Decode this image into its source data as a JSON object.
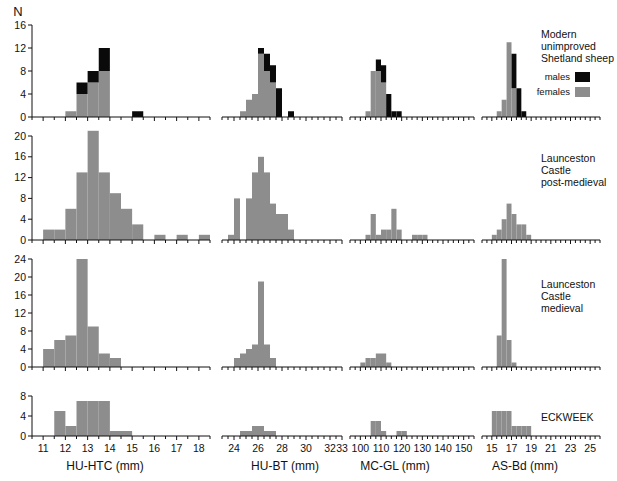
{
  "figure": {
    "y_axis_label": "N",
    "colors": {
      "males": "#0a0a0a",
      "females": "#8d8d8d",
      "axis": "#111111"
    },
    "legend": {
      "title_line1": "Modern",
      "title_line2": "unimproved",
      "title_line3": "Shetland sheep",
      "males_label": "males",
      "females_label": "females"
    },
    "row_labels": [
      {
        "lines": [
          "Modern",
          "unimproved",
          "Shetland sheep"
        ]
      },
      {
        "lines": [
          "Launceston",
          "Castle",
          "post-medieval"
        ]
      },
      {
        "lines": [
          "Launceston",
          "Castle",
          "medieval"
        ]
      },
      {
        "lines": [
          "ECKWEEK"
        ]
      }
    ],
    "column_titles": [
      "HU-HTC (mm)",
      "HU-BT (mm)",
      "MC-GL (mm)",
      "AS-Bd (mm)"
    ]
  },
  "chart_data": [
    {
      "type": "bar",
      "title": "Modern unimproved Shetland sheep — HU-HTC",
      "row": "Modern unimproved Shetland sheep",
      "xlabel": "HU-HTC (mm)",
      "ylabel": "N",
      "xlim": [
        10.5,
        18.5
      ],
      "ylim": [
        0,
        16
      ],
      "yticks": [
        0,
        4,
        8,
        12,
        16
      ],
      "xticks": [
        11,
        12,
        13,
        14,
        15,
        16,
        17,
        18
      ],
      "bin_width": 0.5,
      "grid": false,
      "series": [
        {
          "name": "females",
          "color": "#8d8d8d",
          "bins": [
            12.0,
            12.5,
            13.0,
            13.5
          ],
          "values": [
            1,
            4,
            6,
            8
          ]
        },
        {
          "name": "males",
          "color": "#0a0a0a",
          "bins": [
            12.5,
            13.0,
            13.5,
            15.0
          ],
          "values": [
            2,
            2,
            4,
            1
          ]
        }
      ]
    },
    {
      "type": "bar",
      "title": "Modern unimproved Shetland sheep — HU-BT",
      "row": "Modern unimproved Shetland sheep",
      "xlabel": "HU-BT (mm)",
      "ylabel": "N",
      "xlim": [
        23.0,
        33.0
      ],
      "ylim": [
        0,
        16
      ],
      "yticks": [
        0,
        4,
        8,
        12,
        16
      ],
      "xticks": [
        24,
        26,
        28,
        30,
        32,
        33
      ],
      "bin_width": 0.5,
      "grid": false,
      "series": [
        {
          "name": "females",
          "color": "#8d8d8d",
          "bins": [
            24.5,
            25.0,
            25.5,
            26.0,
            26.5,
            27.0
          ],
          "values": [
            1,
            3,
            4,
            11,
            8,
            6
          ]
        },
        {
          "name": "males",
          "color": "#0a0a0a",
          "bins": [
            26.0,
            26.5,
            27.0,
            27.5,
            28.5
          ],
          "values": [
            1,
            3,
            3,
            5,
            1
          ]
        }
      ]
    },
    {
      "type": "bar",
      "title": "Modern unimproved Shetland sheep — MC-GL",
      "row": "Modern unimproved Shetland sheep",
      "xlabel": "MC-GL (mm)",
      "ylabel": "N",
      "xlim": [
        95,
        155
      ],
      "ylim": [
        0,
        16
      ],
      "yticks": [
        0,
        4,
        8,
        12,
        16
      ],
      "xticks": [
        100,
        110,
        120,
        130,
        140,
        150
      ],
      "bin_width": 2.5,
      "grid": false,
      "series": [
        {
          "name": "females",
          "color": "#8d8d8d",
          "bins": [
            102.5,
            105.0,
            107.5,
            110.0
          ],
          "values": [
            1,
            8,
            8,
            6
          ]
        },
        {
          "name": "males",
          "color": "#0a0a0a",
          "bins": [
            107.5,
            110.0,
            112.5,
            115.0,
            117.5
          ],
          "values": [
            2,
            3,
            4,
            1,
            1
          ]
        }
      ]
    },
    {
      "type": "bar",
      "title": "Modern unimproved Shetland sheep — AS-Bd",
      "row": "Modern unimproved Shetland sheep",
      "xlabel": "AS-Bd (mm)",
      "ylabel": "N",
      "xlim": [
        14,
        26
      ],
      "ylim": [
        0,
        16
      ],
      "yticks": [
        0,
        4,
        8,
        12,
        16
      ],
      "xticks": [
        15,
        17,
        19,
        21,
        23,
        25
      ],
      "bin_width": 0.5,
      "grid": false,
      "series": [
        {
          "name": "females",
          "color": "#8d8d8d",
          "bins": [
            15.5,
            16.0,
            16.5,
            17.0
          ],
          "values": [
            1,
            3,
            13,
            5
          ]
        },
        {
          "name": "males",
          "color": "#0a0a0a",
          "bins": [
            17.0,
            17.5,
            18.0
          ],
          "values": [
            6,
            5,
            1
          ]
        }
      ]
    },
    {
      "type": "bar",
      "title": "Launceston Castle post-medieval — HU-HTC",
      "row": "Launceston Castle post-medieval",
      "xlabel": "HU-HTC (mm)",
      "ylabel": "N",
      "xlim": [
        10.5,
        18.5
      ],
      "ylim": [
        0,
        20
      ],
      "yticks": [
        0,
        4,
        8,
        12,
        16,
        20
      ],
      "xticks": [
        11,
        12,
        13,
        14,
        15,
        16,
        17,
        18
      ],
      "bin_width": 0.5,
      "grid": false,
      "series": [
        {
          "name": "females",
          "color": "#8d8d8d",
          "bins": [
            11.0,
            11.5,
            12.0,
            12.5,
            13.0,
            13.5,
            14.0,
            14.5,
            15.0,
            16.0,
            17.0,
            18.0
          ],
          "values": [
            2,
            2,
            6,
            13,
            21,
            13,
            9,
            6,
            3,
            1,
            1,
            1
          ]
        }
      ]
    },
    {
      "type": "bar",
      "title": "Launceston Castle post-medieval — HU-BT",
      "row": "Launceston Castle post-medieval",
      "xlabel": "HU-BT (mm)",
      "ylabel": "N",
      "xlim": [
        23.0,
        33.0
      ],
      "ylim": [
        0,
        20
      ],
      "yticks": [
        0,
        4,
        8,
        12,
        16,
        20
      ],
      "xticks": [
        24,
        26,
        28,
        30,
        32,
        33
      ],
      "bin_width": 0.5,
      "grid": false,
      "series": [
        {
          "name": "females",
          "color": "#8d8d8d",
          "bins": [
            23.5,
            24.0,
            25.0,
            25.5,
            26.0,
            26.5,
            27.0,
            27.5,
            28.0,
            28.5
          ],
          "values": [
            1,
            8,
            8,
            13,
            16,
            13,
            7,
            5,
            5,
            2
          ]
        }
      ]
    },
    {
      "type": "bar",
      "title": "Launceston Castle post-medieval — MC-GL",
      "row": "Launceston Castle post-medieval",
      "xlabel": "MC-GL (mm)",
      "ylabel": "N",
      "xlim": [
        95,
        155
      ],
      "ylim": [
        0,
        20
      ],
      "yticks": [
        0,
        4,
        8,
        12,
        16,
        20
      ],
      "xticks": [
        100,
        110,
        120,
        130,
        140,
        150
      ],
      "bin_width": 2.5,
      "grid": false,
      "series": [
        {
          "name": "females",
          "color": "#8d8d8d",
          "bins": [
            102.5,
            105.0,
            107.5,
            110.0,
            112.5,
            115.0,
            117.5,
            125.0,
            127.5,
            130.0
          ],
          "values": [
            1,
            5,
            1,
            2,
            2,
            6,
            2,
            1,
            1,
            1
          ]
        }
      ]
    },
    {
      "type": "bar",
      "title": "Launceston Castle post-medieval — AS-Bd",
      "row": "Launceston Castle post-medieval",
      "xlabel": "AS-Bd (mm)",
      "ylabel": "N",
      "xlim": [
        14,
        26
      ],
      "ylim": [
        0,
        20
      ],
      "yticks": [
        0,
        4,
        8,
        12,
        16,
        20
      ],
      "xticks": [
        15,
        17,
        19,
        21,
        23,
        25
      ],
      "bin_width": 0.5,
      "grid": false,
      "series": [
        {
          "name": "females",
          "color": "#8d8d8d",
          "bins": [
            15.0,
            15.5,
            16.0,
            16.5,
            17.0,
            17.5,
            18.0,
            18.5
          ],
          "values": [
            1,
            2,
            4,
            7,
            5,
            3,
            3,
            1
          ]
        }
      ]
    },
    {
      "type": "bar",
      "title": "Launceston Castle medieval — HU-HTC",
      "row": "Launceston Castle medieval",
      "xlabel": "HU-HTC (mm)",
      "ylabel": "N",
      "xlim": [
        10.5,
        18.5
      ],
      "ylim": [
        0,
        24
      ],
      "yticks": [
        0,
        4,
        8,
        12,
        16,
        20,
        24
      ],
      "xticks": [
        11,
        12,
        13,
        14,
        15,
        16,
        17,
        18
      ],
      "bin_width": 0.5,
      "grid": false,
      "series": [
        {
          "name": "females",
          "color": "#8d8d8d",
          "bins": [
            11.0,
            11.5,
            12.0,
            12.5,
            13.0,
            13.5,
            14.0
          ],
          "values": [
            4,
            6,
            7,
            24,
            9,
            3,
            2
          ]
        }
      ]
    },
    {
      "type": "bar",
      "title": "Launceston Castle medieval — HU-BT",
      "row": "Launceston Castle medieval",
      "xlabel": "HU-BT (mm)",
      "ylabel": "N",
      "xlim": [
        23.0,
        33.0
      ],
      "ylim": [
        0,
        24
      ],
      "yticks": [
        0,
        4,
        8,
        12,
        16,
        20,
        24
      ],
      "xticks": [
        24,
        26,
        28,
        30,
        32,
        33
      ],
      "bin_width": 0.5,
      "grid": false,
      "series": [
        {
          "name": "females",
          "color": "#8d8d8d",
          "bins": [
            24.0,
            24.5,
            25.0,
            25.5,
            26.0,
            26.5,
            27.0
          ],
          "values": [
            2,
            3,
            4,
            5,
            19,
            5,
            2
          ]
        }
      ]
    },
    {
      "type": "bar",
      "title": "Launceston Castle medieval — MC-GL",
      "row": "Launceston Castle medieval",
      "xlabel": "MC-GL (mm)",
      "ylabel": "N",
      "xlim": [
        95,
        155
      ],
      "ylim": [
        0,
        24
      ],
      "yticks": [
        0,
        4,
        8,
        12,
        16,
        20,
        24
      ],
      "xticks": [
        100,
        110,
        120,
        130,
        140,
        150
      ],
      "bin_width": 2.5,
      "grid": false,
      "series": [
        {
          "name": "females",
          "color": "#8d8d8d",
          "bins": [
            100.0,
            102.5,
            105.0,
            107.5,
            110.0,
            112.5
          ],
          "values": [
            1,
            2,
            2,
            3,
            3,
            1
          ]
        }
      ]
    },
    {
      "type": "bar",
      "title": "Launceston Castle medieval — AS-Bd",
      "row": "Launceston Castle medieval",
      "xlabel": "AS-Bd (mm)",
      "ylabel": "N",
      "xlim": [
        14,
        26
      ],
      "ylim": [
        0,
        24
      ],
      "yticks": [
        0,
        4,
        8,
        12,
        16,
        20,
        24
      ],
      "xticks": [
        15,
        17,
        19,
        21,
        23,
        25
      ],
      "bin_width": 0.5,
      "grid": false,
      "series": [
        {
          "name": "females",
          "color": "#8d8d8d",
          "bins": [
            15.5,
            16.0,
            16.5,
            17.0
          ],
          "values": [
            7,
            24,
            6,
            1
          ]
        }
      ]
    },
    {
      "type": "bar",
      "title": "ECKWEEK — HU-HTC",
      "row": "ECKWEEK",
      "xlabel": "HU-HTC (mm)",
      "ylabel": "N",
      "xlim": [
        10.5,
        18.5
      ],
      "ylim": [
        0,
        8
      ],
      "yticks": [
        0,
        4,
        8
      ],
      "xticks": [
        11,
        12,
        13,
        14,
        15,
        16,
        17,
        18
      ],
      "bin_width": 0.5,
      "grid": false,
      "series": [
        {
          "name": "females",
          "color": "#8d8d8d",
          "bins": [
            11.5,
            12.0,
            12.5,
            13.0,
            13.5,
            14.0,
            14.5
          ],
          "values": [
            5,
            2,
            7,
            7,
            7,
            1,
            1
          ]
        }
      ]
    },
    {
      "type": "bar",
      "title": "ECKWEEK — HU-BT",
      "row": "ECKWEEK",
      "xlabel": "HU-BT (mm)",
      "ylabel": "N",
      "xlim": [
        23.0,
        33.0
      ],
      "ylim": [
        0,
        8
      ],
      "yticks": [
        0,
        4,
        8
      ],
      "xticks": [
        24,
        26,
        28,
        30,
        32,
        33
      ],
      "bin_width": 0.5,
      "grid": false,
      "series": [
        {
          "name": "females",
          "color": "#8d8d8d",
          "bins": [
            24.5,
            25.0,
            25.5,
            26.0,
            26.5,
            27.0
          ],
          "values": [
            1,
            1,
            2,
            2,
            1,
            1
          ]
        }
      ]
    },
    {
      "type": "bar",
      "title": "ECKWEEK — MC-GL",
      "row": "ECKWEEK",
      "xlabel": "MC-GL (mm)",
      "ylabel": "N",
      "xlim": [
        95,
        155
      ],
      "ylim": [
        0,
        8
      ],
      "yticks": [
        0,
        4,
        8
      ],
      "xticks": [
        100,
        110,
        120,
        130,
        140,
        150
      ],
      "bin_width": 2.5,
      "grid": false,
      "series": [
        {
          "name": "females",
          "color": "#8d8d8d",
          "bins": [
            105.0,
            107.5,
            110.0,
            117.5,
            120.0
          ],
          "values": [
            3,
            3,
            1,
            1,
            1
          ]
        }
      ]
    },
    {
      "type": "bar",
      "title": "ECKWEEK — AS-Bd",
      "row": "ECKWEEK",
      "xlabel": "AS-Bd (mm)",
      "ylabel": "N",
      "xlim": [
        14,
        26
      ],
      "ylim": [
        0,
        8
      ],
      "yticks": [
        0,
        4,
        8
      ],
      "xticks": [
        15,
        17,
        19,
        21,
        23,
        25
      ],
      "bin_width": 0.5,
      "grid": false,
      "series": [
        {
          "name": "females",
          "color": "#8d8d8d",
          "bins": [
            15.0,
            15.5,
            16.0,
            16.5,
            17.0,
            17.5,
            18.0,
            18.5
          ],
          "values": [
            5,
            5,
            5,
            5,
            2,
            2,
            2,
            2
          ]
        }
      ]
    }
  ]
}
